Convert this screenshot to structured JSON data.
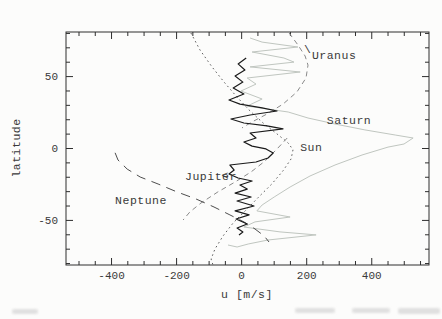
{
  "figure": {
    "background": "#fcfcfb",
    "frame_color": "#2e2e2e",
    "tick_color": "#2e2e2e",
    "tick_label_color": "#3a3a3a"
  },
  "chart_data": {
    "type": "line",
    "title": "",
    "xlabel": "u [m/s]",
    "ylabel": "latitude",
    "xlim": [
      -540,
      576
    ],
    "ylim": [
      -81,
      81
    ],
    "x_major_ticks": [
      -400,
      -200,
      0,
      200,
      400
    ],
    "x_tick_labels": [
      "-400",
      "-200",
      "0",
      "200",
      "400"
    ],
    "x_minor_step": 50,
    "y_major_ticks": [
      -50,
      0,
      50
    ],
    "y_tick_labels": [
      "-50",
      "0",
      "50"
    ],
    "y_minor_step": 10,
    "grid": false,
    "legend_position": "none",
    "series": [
      {
        "name": "Saturn",
        "style": "solid",
        "color": "#c0c6c0",
        "width": 1.0,
        "points": [
          [
            26,
            76.8
          ],
          [
            63,
            74
          ],
          [
            173,
            70.6
          ],
          [
            32,
            67.1
          ],
          [
            130,
            62.9
          ],
          [
            161,
            60.1
          ],
          [
            26,
            56.7
          ],
          [
            180,
            53.2
          ],
          [
            17,
            49
          ],
          [
            44,
            44.8
          ],
          [
            -2,
            40
          ],
          [
            63,
            34.4
          ],
          [
            17,
            29.5
          ],
          [
            143,
            25.4
          ],
          [
            204,
            21.2
          ],
          [
            287,
            17
          ],
          [
            379,
            12.9
          ],
          [
            472,
            9.4
          ],
          [
            527,
            7.3
          ],
          [
            499,
            3.1
          ],
          [
            450,
            1
          ],
          [
            370,
            -4.5
          ],
          [
            287,
            -11.5
          ],
          [
            210,
            -19.1
          ],
          [
            149,
            -26.8
          ],
          [
            100,
            -33.7
          ],
          [
            63,
            -39.3
          ],
          [
            47,
            -43.4
          ],
          [
            149,
            -47.6
          ],
          [
            41,
            -51
          ],
          [
            7,
            -54.6
          ],
          [
            118,
            -58
          ],
          [
            229,
            -60.1
          ],
          [
            81,
            -63.6
          ],
          [
            20,
            -66.4
          ],
          [
            -14,
            -68.5
          ],
          [
            -42,
            -67.1
          ]
        ]
      },
      {
        "name": "Sun",
        "style": "dotted",
        "color": "#5f5f5f",
        "width": 1.0,
        "points": [
          [
            -156,
            80.3
          ],
          [
            -128,
            68.5
          ],
          [
            -91,
            56.7
          ],
          [
            -54,
            46.2
          ],
          [
            -17,
            36.5
          ],
          [
            23,
            26.8
          ],
          [
            66,
            17.7
          ],
          [
            109,
            10.1
          ],
          [
            143,
            3.8
          ],
          [
            158,
            -0.9
          ],
          [
            152,
            -7.2
          ],
          [
            127,
            -15.5
          ],
          [
            93,
            -24.6
          ],
          [
            53,
            -33.6
          ],
          [
            14,
            -42.7
          ],
          [
            -26,
            -51.7
          ],
          [
            -57,
            -60.8
          ],
          [
            -82,
            -69.8
          ],
          [
            -94,
            -76.8
          ],
          [
            -88,
            -81
          ]
        ]
      },
      {
        "name": "Uranus",
        "style": "dashed",
        "color": "#8a8a8a",
        "width": 1.0,
        "segments": [
          [
            [
              146,
              80.3
            ],
            [
              173,
              72
            ],
            [
              195,
              64.3
            ],
            [
              204,
              58
            ],
            [
              198,
              49
            ],
            [
              170,
              39.3
            ],
            [
              127,
              30.9
            ],
            [
              78,
              24
            ],
            [
              32,
              18.5
            ],
            [
              1,
              14.3
            ]
          ],
          [
            [
              140,
              7.3
            ],
            [
              109,
              -0.3
            ],
            [
              72,
              -8.7
            ],
            [
              29,
              -16.3
            ],
            [
              -20,
              -23.3
            ],
            [
              -73,
              -30.2
            ],
            [
              -125,
              -37.9
            ],
            [
              -159,
              -44.1
            ],
            [
              -180,
              -49.7
            ]
          ]
        ]
      },
      {
        "name": "Neptune",
        "style": "longdash",
        "color": "#4d4d4d",
        "width": 1.0,
        "points": [
          [
            -389,
            -3
          ],
          [
            -380,
            -8
          ],
          [
            -352,
            -14.3
          ],
          [
            -312,
            -19.8
          ],
          [
            -257,
            -24.7
          ],
          [
            -199,
            -30.2
          ],
          [
            -140,
            -35.1
          ],
          [
            -85,
            -40.7
          ],
          [
            -36,
            -46.2
          ],
          [
            7,
            -51
          ],
          [
            41,
            -56
          ],
          [
            69,
            -60.8
          ],
          [
            84,
            -65
          ]
        ]
      },
      {
        "name": "Jupiter",
        "style": "solid",
        "color": "#1a1a1a",
        "width": 1.2,
        "points": [
          [
            14,
            62.9
          ],
          [
            -11,
            58.8
          ],
          [
            10,
            54.6
          ],
          [
            -20,
            50.4
          ],
          [
            4,
            46.2
          ],
          [
            -26,
            42.1
          ],
          [
            7,
            37.9
          ],
          [
            -39,
            33.7
          ],
          [
            -5,
            30.9
          ],
          [
            63,
            28.2
          ],
          [
            109,
            26.1
          ],
          [
            26,
            23.3
          ],
          [
            -33,
            20.5
          ],
          [
            7,
            17.7
          ],
          [
            78,
            15.7
          ],
          [
            127,
            13.6
          ],
          [
            26,
            10.8
          ],
          [
            44,
            7.3
          ],
          [
            7,
            4.5
          ],
          [
            32,
            1.7
          ],
          [
            75,
            -0.3
          ],
          [
            97,
            -3.1
          ],
          [
            81,
            -6.6
          ],
          [
            44,
            -9.4
          ],
          [
            -36,
            -11.5
          ],
          [
            -23,
            -15
          ],
          [
            -39,
            -17.7
          ],
          [
            -11,
            -20.5
          ],
          [
            32,
            -22.6
          ],
          [
            -5,
            -25.4
          ],
          [
            17,
            -28.2
          ],
          [
            -20,
            -31
          ],
          [
            29,
            -33.7
          ],
          [
            -14,
            -36.5
          ],
          [
            38,
            -40
          ],
          [
            -20,
            -43.4
          ],
          [
            23,
            -46.2
          ],
          [
            -17,
            -49
          ],
          [
            17,
            -52.5
          ],
          [
            -14,
            -55.3
          ],
          [
            4,
            -58
          ],
          [
            -8,
            -60.1
          ]
        ]
      }
    ],
    "annotations": [
      {
        "id": "uranus-label",
        "text": "Uranus",
        "u": 216,
        "lat": 65
      },
      {
        "id": "uranus-leader",
        "text": "\\",
        "u": 192,
        "lat": 69
      },
      {
        "id": "saturn-label",
        "text": "Saturn",
        "u": 262,
        "lat": 20
      },
      {
        "id": "sun-label",
        "text": "Sun",
        "u": 180,
        "lat": 1
      },
      {
        "id": "jupiter-label",
        "text": "Jupiter",
        "u": -174,
        "lat": -19
      },
      {
        "id": "jupiter-arrow",
        "text": "<",
        "u": -62,
        "lat": -18.5
      },
      {
        "id": "neptune-label",
        "text": "Neptune",
        "u": -389,
        "lat": -36
      }
    ]
  }
}
